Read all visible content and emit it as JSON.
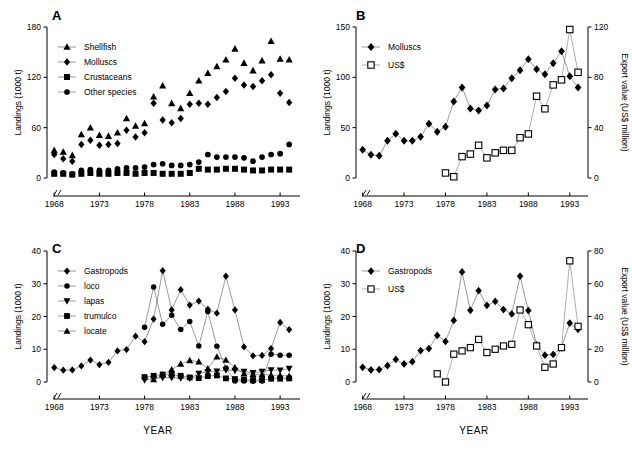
{
  "figure": {
    "xlabel": "YEAR",
    "xtick_labels": [
      "1968",
      "1973",
      "1978",
      "1983",
      "1988",
      "1993"
    ],
    "xticks": [
      1968,
      1973,
      1978,
      1983,
      1988,
      1993
    ],
    "xlim": [
      1967.2,
      1995.2
    ],
    "axis_break": true,
    "ylabel_landings": "Landings (1000 t)",
    "ylabel_export": "Export value (US$ million)"
  },
  "panels": {
    "A": {
      "letter": "A"
    },
    "B": {
      "letter": "B"
    },
    "C": {
      "letter": "C"
    },
    "D": {
      "letter": "D"
    }
  },
  "chart_data": [
    {
      "panel": "A",
      "type": "scatter",
      "title": "A",
      "xlabel": "YEAR",
      "ylabel": "Landings (1000 t)",
      "xlim": [
        1967.2,
        1995.2
      ],
      "ylim": [
        0,
        180
      ],
      "yticks": [
        0,
        60,
        120,
        180
      ],
      "xticks": [
        1968,
        1973,
        1978,
        1983,
        1988,
        1993
      ],
      "grid": false,
      "legend_position": "top-left",
      "x": [
        1968,
        1969,
        1970,
        1971,
        1972,
        1973,
        1974,
        1975,
        1976,
        1977,
        1978,
        1979,
        1980,
        1981,
        1982,
        1983,
        1984,
        1985,
        1986,
        1987,
        1988,
        1989,
        1990,
        1991,
        1992,
        1993,
        1994
      ],
      "series": [
        {
          "name": "Shellfish",
          "marker": "triangle-up",
          "filled": true,
          "values": [
            33,
            31,
            27,
            52,
            60,
            51,
            50,
            54,
            71,
            62,
            65,
            97,
            110,
            89,
            83,
            101,
            116,
            125,
            133,
            141,
            154,
            137,
            128,
            140,
            163,
            142,
            141
          ]
        },
        {
          "name": "Molluscs",
          "marker": "diamond",
          "filled": true,
          "values": [
            28,
            23,
            20,
            40,
            45,
            39,
            40,
            41,
            57,
            49,
            54,
            89,
            69,
            66,
            71,
            88,
            89,
            88,
            96,
            103,
            119,
            111,
            109,
            116,
            123,
            101,
            90
          ]
        },
        {
          "name": "Crustaceans",
          "marker": "square",
          "filled": true,
          "values": [
            5,
            5,
            4,
            5,
            6,
            5,
            5,
            6,
            6,
            5,
            6,
            6,
            5,
            5,
            5,
            6,
            11,
            10,
            10,
            11,
            11,
            10,
            9,
            9,
            10,
            10,
            10
          ]
        },
        {
          "name": "Other species",
          "marker": "circle",
          "filled": true,
          "values": [
            7,
            6,
            5,
            9,
            10,
            9,
            9,
            11,
            12,
            12,
            13,
            16,
            17,
            15,
            15,
            16,
            19,
            28,
            25,
            25,
            25,
            24,
            20,
            25,
            28,
            29,
            40
          ]
        }
      ]
    },
    {
      "panel": "B",
      "type": "scatter",
      "title": "B",
      "xlabel": "YEAR",
      "ylabel": "Landings (1000 t)",
      "ylabel_right": "Export value (US$ million)",
      "xlim": [
        1967.2,
        1995.2
      ],
      "ylim": [
        0,
        150
      ],
      "ylim_right": [
        0,
        120
      ],
      "yticks": [
        0,
        50,
        100,
        150
      ],
      "yticks_right": [
        0,
        40,
        80,
        120
      ],
      "xticks": [
        1968,
        1973,
        1978,
        1983,
        1988,
        1993
      ],
      "grid": false,
      "legend_position": "top-left",
      "series": [
        {
          "name": "Molluscs",
          "marker": "diamond",
          "filled": true,
          "axis": "left",
          "x": [
            1968,
            1969,
            1970,
            1971,
            1972,
            1973,
            1974,
            1975,
            1976,
            1977,
            1978,
            1979,
            1980,
            1981,
            1982,
            1983,
            1984,
            1985,
            1986,
            1987,
            1988,
            1989,
            1990,
            1991,
            1992,
            1993,
            1994
          ],
          "values": [
            28,
            23,
            22,
            37,
            44,
            37,
            37,
            41,
            54,
            46,
            51,
            76,
            90,
            69,
            67,
            72,
            88,
            89,
            99,
            107,
            118,
            108,
            103,
            114,
            126,
            101,
            90
          ]
        },
        {
          "name": "US$",
          "marker": "square",
          "filled": false,
          "axis": "right",
          "x": [
            1978,
            1979,
            1980,
            1981,
            1982,
            1983,
            1984,
            1985,
            1986,
            1987,
            1988,
            1989,
            1990,
            1991,
            1992,
            1993,
            1994
          ],
          "values": [
            4,
            1,
            17,
            19,
            26,
            16,
            20,
            22,
            22,
            32,
            35,
            65,
            55,
            74,
            78,
            118,
            84
          ]
        }
      ]
    },
    {
      "panel": "C",
      "type": "scatter",
      "title": "C",
      "xlabel": "YEAR",
      "ylabel": "Landings (1000 t)",
      "xlim": [
        1967.2,
        1995.2
      ],
      "ylim": [
        0,
        40
      ],
      "yticks": [
        0,
        10,
        20,
        30,
        40
      ],
      "xticks": [
        1968,
        1973,
        1978,
        1983,
        1988,
        1993
      ],
      "grid": false,
      "legend_position": "top-left",
      "series": [
        {
          "name": "Gastropods",
          "marker": "diamond",
          "filled": true,
          "x": [
            1968,
            1969,
            1970,
            1971,
            1972,
            1973,
            1974,
            1975,
            1976,
            1977,
            1978,
            1979,
            1980,
            1981,
            1982,
            1983,
            1984,
            1985,
            1986,
            1987,
            1988,
            1989,
            1990,
            1991,
            1992,
            1993,
            1994
          ],
          "values": [
            4.4,
            3.6,
            3.7,
            4.9,
            6.7,
            5.3,
            6.0,
            9.5,
            9.9,
            14.0,
            12.3,
            19.2,
            34.0,
            22.0,
            28.2,
            23.5,
            24.7,
            22.2,
            21.0,
            32.3,
            22.0,
            10.7,
            8.0,
            8.1,
            10.2,
            18.2,
            16.0
          ]
        },
        {
          "name": "loco",
          "marker": "circle",
          "filled": true,
          "x": [
            1978,
            1979,
            1980,
            1981,
            1982,
            1983,
            1984,
            1985,
            1986,
            1987,
            1988,
            1989,
            1990,
            1991,
            1992,
            1993,
            1994
          ],
          "values": [
            16.7,
            29.0,
            17.6,
            20.4,
            16.0,
            18.5,
            11.0,
            21.5,
            10.9,
            4.3,
            0.3,
            0.3,
            0.2,
            0.3,
            8.5,
            8.2,
            8.2
          ]
        },
        {
          "name": "lapas",
          "marker": "triangle-down",
          "filled": true,
          "x": [
            1978,
            1979,
            1980,
            1981,
            1982,
            1983,
            1984,
            1985,
            1986,
            1987,
            1988,
            1989,
            1990,
            1991,
            1992,
            1993,
            1994
          ],
          "values": [
            0.6,
            1.0,
            1.3,
            1.3,
            1.2,
            1.1,
            2.6,
            3.1,
            3.3,
            3.6,
            3.5,
            3.2,
            2.8,
            3.2,
            3.7,
            3.6,
            4.1
          ]
        },
        {
          "name": "trumulco",
          "marker": "square",
          "filled": true,
          "x": [
            1978,
            1979,
            1980,
            1981,
            1982,
            1983,
            1984,
            1985,
            1986,
            1987,
            1988,
            1989,
            1990,
            1991,
            1992,
            1993,
            1994
          ],
          "values": [
            1.5,
            1.9,
            2.3,
            2.2,
            1.9,
            1.4,
            1.2,
            1.8,
            2.0,
            1.1,
            0.9,
            0.7,
            0.6,
            0.6,
            1.0,
            1.0,
            1.1
          ]
        },
        {
          "name": "locate",
          "marker": "triangle-up",
          "filled": true,
          "x": [
            1979,
            1980,
            1981,
            1982,
            1983,
            1984,
            1985,
            1986,
            1987,
            1988,
            1989,
            1990,
            1991,
            1992,
            1993,
            1994
          ],
          "values": [
            0.8,
            2.2,
            3.8,
            5.5,
            6.6,
            6.2,
            4.1,
            7.7,
            6.7,
            4.4,
            2.5,
            2.4,
            2.3,
            2.1,
            2.0,
            1.8
          ]
        }
      ]
    },
    {
      "panel": "D",
      "type": "scatter",
      "title": "D",
      "xlabel": "YEAR",
      "ylabel": "Landings (1000 t)",
      "ylabel_right": "Export value (US$ million)",
      "xlim": [
        1967.2,
        1995.2
      ],
      "ylim": [
        0,
        40
      ],
      "ylim_right": [
        0,
        80
      ],
      "yticks": [
        0,
        10,
        20,
        30,
        40
      ],
      "yticks_right": [
        0,
        20,
        40,
        60,
        80
      ],
      "xticks": [
        1968,
        1973,
        1978,
        1983,
        1988,
        1993
      ],
      "grid": false,
      "legend_position": "top-left",
      "series": [
        {
          "name": "Gastropods",
          "marker": "diamond",
          "filled": true,
          "axis": "left",
          "x": [
            1968,
            1969,
            1970,
            1971,
            1972,
            1973,
            1974,
            1975,
            1976,
            1977,
            1978,
            1979,
            1980,
            1981,
            1982,
            1983,
            1984,
            1985,
            1986,
            1987,
            1988,
            1989,
            1990,
            1991,
            1992,
            1993,
            1994
          ],
          "values": [
            4.5,
            3.7,
            3.8,
            5.0,
            6.9,
            5.5,
            6.2,
            9.6,
            10.2,
            14.2,
            12.4,
            18.8,
            33.6,
            21.9,
            27.9,
            23.4,
            24.6,
            22.1,
            20.8,
            32.3,
            21.8,
            11.3,
            8.2,
            8.4,
            10.5,
            18.0,
            16.1
          ]
        },
        {
          "name": "US$",
          "marker": "square",
          "filled": false,
          "axis": "right",
          "x": [
            1977,
            1978,
            1979,
            1980,
            1981,
            1982,
            1983,
            1984,
            1985,
            1986,
            1987,
            1988,
            1989,
            1990,
            1991,
            1992,
            1993,
            1994
          ],
          "values": [
            5,
            0,
            17,
            19,
            21,
            26,
            18,
            20,
            22,
            23,
            44,
            35,
            22,
            9,
            11,
            21,
            74,
            34
          ]
        }
      ]
    }
  ]
}
